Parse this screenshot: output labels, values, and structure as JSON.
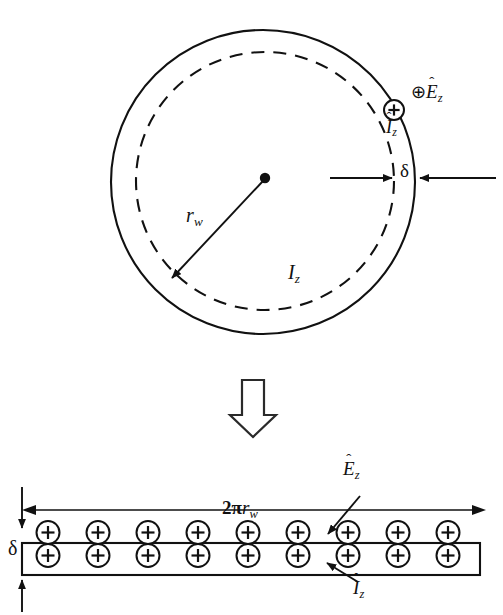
{
  "figure": {
    "background_color": "#ffffff",
    "stroke_color": "#111111",
    "width": 503,
    "height": 615
  },
  "upper_diagram": {
    "name": "wire-cross-section",
    "description": "Circular wire cross-section with outer solid boundary, inner dashed boundary, radius arrow and skin-depth annotation",
    "outer_circle": {
      "cx": 263,
      "cy": 182,
      "r": 152,
      "style": "solid"
    },
    "inner_circle": {
      "cx": 265,
      "cy": 181,
      "r": 129,
      "style": "dashed"
    },
    "center_dot": {
      "cx": 265,
      "cy": 178,
      "r": 5
    },
    "radius_label": {
      "symbol": "r",
      "subscript": "w",
      "text": "r_w"
    },
    "current_label": {
      "symbol": "I",
      "subscript": "z",
      "text": "I_z"
    },
    "thickness_label": {
      "symbol": "δ",
      "text": "δ"
    },
    "field_label": {
      "symbol": "E",
      "subscript": "z",
      "hat": true,
      "charge": "⊕",
      "text": "⊕Ê_z"
    },
    "surface_current_label": {
      "symbol": "I",
      "subscript": "z",
      "hat": true,
      "charge": "⊕",
      "text": "⊕Î_z"
    }
  },
  "transform_arrow": {
    "name": "downward-hollow-arrow",
    "glyph": "⇓",
    "direction": "down"
  },
  "lower_diagram": {
    "name": "unrolled-strip",
    "description": "Rectangular strip representing the unrolled circumference with nine pairs of positive charge markers",
    "strip": {
      "x": 22,
      "y": 543,
      "width": 458,
      "height": 32
    },
    "charge_pairs_count": 9,
    "charge_symbol": "⊕",
    "charge_positions_x": [
      48,
      98,
      148,
      198,
      248,
      298,
      348,
      398,
      448
    ],
    "width_label": {
      "prefix": "2π",
      "symbol": "r",
      "subscript": "w",
      "text": "2πr_w"
    },
    "thickness_label": {
      "symbol": "δ",
      "text": "δ"
    },
    "field_label": {
      "symbol": "E",
      "subscript": "z",
      "hat": true,
      "text": "Ê_z"
    },
    "current_label": {
      "symbol": "I",
      "subscript": "z",
      "hat": true,
      "text": "Î_z"
    }
  }
}
